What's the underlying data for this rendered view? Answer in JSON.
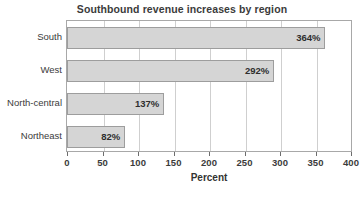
{
  "chart_data": {
    "type": "bar",
    "orientation": "horizontal",
    "title": "Southbound revenue increases by region",
    "xlabel": "Percent",
    "ylabel": "",
    "categories": [
      "Northeast",
      "North-central",
      "West",
      "South"
    ],
    "values": [
      82,
      137,
      292,
      364
    ],
    "data_labels": [
      "82%",
      "137%",
      "292%",
      "364%"
    ],
    "xlim": [
      0,
      400
    ],
    "xticks": [
      0,
      50,
      100,
      150,
      200,
      250,
      300,
      350,
      400
    ],
    "xtick_labels": [
      "0",
      "50",
      "100",
      "150",
      "200",
      "250",
      "300",
      "350",
      "400"
    ],
    "grid": "vertical",
    "legend": "none",
    "bar_fill_color": "#d5d5d5",
    "bar_border_color": "#9d9d9d",
    "gridline_color": "#cfcfcf",
    "frame_color": "#a8a8a8",
    "text_color": "#3b3b3b"
  }
}
